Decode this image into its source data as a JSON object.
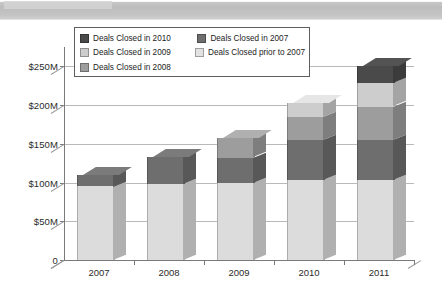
{
  "chart_data": {
    "type": "bar",
    "subtype": "stacked-column-3d",
    "title": "",
    "xlabel": "",
    "ylabel": "",
    "categories": [
      "2007",
      "2008",
      "2009",
      "2010",
      "2011"
    ],
    "ylim": [
      0,
      275
    ],
    "yticks": [
      0,
      50,
      100,
      150,
      200,
      250
    ],
    "ytick_labels": [
      "0",
      "$50M",
      "$100M",
      "$150M",
      "$200M",
      "$250M"
    ],
    "grid": true,
    "legend_position": "top-inside",
    "units": "millions of USD",
    "series": [
      {
        "name": "Deals Closed prior to 2007",
        "color": "#dcdcdc",
        "values": [
          95,
          98,
          100,
          103,
          103
        ]
      },
      {
        "name": "Deals Closed in 2007",
        "color": "#6e6e6e",
        "values": [
          15,
          35,
          32,
          52,
          52
        ]
      },
      {
        "name": "Deals Closed in 2008",
        "color": "#9d9d9d",
        "values": [
          0,
          0,
          25,
          30,
          43
        ]
      },
      {
        "name": "Deals Closed in 2009",
        "color": "#cdcdcd",
        "values": [
          0,
          0,
          0,
          18,
          30
        ]
      },
      {
        "name": "Deals Closed in 2010",
        "color": "#4a4a4a",
        "values": [
          0,
          0,
          0,
          0,
          22
        ]
      }
    ],
    "totals": [
      110,
      133,
      157,
      203,
      250
    ]
  },
  "legend": {
    "rows": [
      [
        {
          "label": "Deals Closed in 2010",
          "color": "#4a4a4a"
        },
        {
          "label": "Deals Closed in 2007",
          "color": "#6e6e6e"
        }
      ],
      [
        {
          "label": "Deals Closed in 2009",
          "color": "#cdcdcd"
        },
        {
          "label": "Deals Closed prior to 2007",
          "color": "#e2e2e2"
        }
      ],
      [
        {
          "label": "Deals Closed in 2008",
          "color": "#9d9d9d"
        }
      ]
    ]
  },
  "colors": {
    "axis": "#7a7a7a",
    "grid": "#b9b9b9",
    "text": "#2b2b2b",
    "scan_band": "#bdbdbd"
  }
}
